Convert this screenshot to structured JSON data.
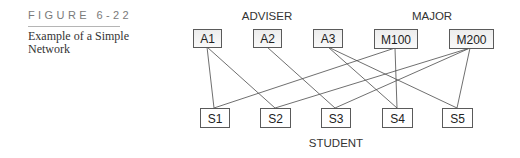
{
  "figure": {
    "number_label": "FIGURE 6-22",
    "caption": "Example of a Simple Network"
  },
  "diagram": {
    "group_labels": {
      "adviser": "ADVISER",
      "major": "MAJOR",
      "student": "STUDENT"
    },
    "colors": {
      "box_fill_top": "#eeeeee",
      "box_fill_bottom": "#ffffff",
      "box_border": "#5a5a5a",
      "edge": "#4a4a4a"
    },
    "top_nodes": [
      {
        "id": "A1",
        "label": "A1",
        "group": "ADVISER"
      },
      {
        "id": "A2",
        "label": "A2",
        "group": "ADVISER"
      },
      {
        "id": "A3",
        "label": "A3",
        "group": "ADVISER"
      },
      {
        "id": "M100",
        "label": "M100",
        "group": "MAJOR"
      },
      {
        "id": "M200",
        "label": "M200",
        "group": "MAJOR"
      }
    ],
    "bottom_nodes": [
      {
        "id": "S1",
        "label": "S1",
        "group": "STUDENT"
      },
      {
        "id": "S2",
        "label": "S2",
        "group": "STUDENT"
      },
      {
        "id": "S3",
        "label": "S3",
        "group": "STUDENT"
      },
      {
        "id": "S4",
        "label": "S4",
        "group": "STUDENT"
      },
      {
        "id": "S5",
        "label": "S5",
        "group": "STUDENT"
      }
    ],
    "edges": [
      [
        "A1",
        "S1"
      ],
      [
        "A1",
        "S2"
      ],
      [
        "A2",
        "S3"
      ],
      [
        "A3",
        "S4"
      ],
      [
        "A3",
        "S5"
      ],
      [
        "M100",
        "S1"
      ],
      [
        "M100",
        "S4"
      ],
      [
        "M200",
        "S2"
      ],
      [
        "M200",
        "S3"
      ],
      [
        "M200",
        "S5"
      ]
    ]
  }
}
